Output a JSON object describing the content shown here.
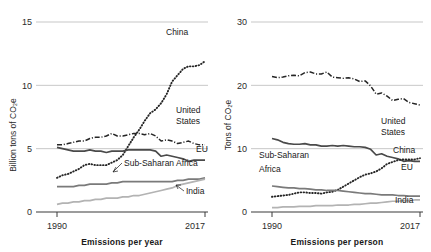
{
  "figure": {
    "panels": [
      {
        "id": "per-year",
        "caption": "Emissions per year",
        "ylabel": "Billion tons of CO₂e",
        "x_start_label": "1990",
        "x_end_label": "2017",
        "yticks": [
          "0",
          "5",
          "10",
          "15"
        ]
      },
      {
        "id": "per-person",
        "caption": "Emissions per person",
        "ylabel": "Tons of CO₂e",
        "x_start_label": "1990",
        "x_end_label": "2017",
        "yticks": [
          "0",
          "10",
          "20",
          "30"
        ]
      }
    ],
    "labels": {
      "china": "China",
      "united_states_line1": "United",
      "united_states_line2": "States",
      "eu": "EU",
      "ssa_one_line": "Sub-Saharan Africa",
      "ssa_line1": "Sub-Saharan",
      "ssa_line2": "Africa",
      "india": "India"
    },
    "colors": {
      "china": "#262626",
      "united_states": "#262626",
      "eu": "#4a4a4a",
      "sub_saharan_africa": "#7a7a7a",
      "india": "#b3b3b3",
      "gridline": "#b9b9b9",
      "axis": "#3a3a3a",
      "text": "#1a1a1a"
    }
  },
  "chart_data": [
    {
      "type": "line",
      "title": "Emissions per year",
      "xlabel": "Emissions per year",
      "ylabel": "Billion tons of CO₂e",
      "xlim": [
        1990,
        2017
      ],
      "ylim": [
        0,
        15
      ],
      "yticks": [
        0,
        5,
        10,
        15
      ],
      "xticks": [
        1990,
        2017
      ],
      "grid": true,
      "legend": "inline-labels",
      "x": [
        1990,
        1991,
        1992,
        1993,
        1994,
        1995,
        1996,
        1997,
        1998,
        1999,
        2000,
        2001,
        2002,
        2003,
        2004,
        2005,
        2006,
        2007,
        2008,
        2009,
        2010,
        2011,
        2012,
        2013,
        2014,
        2015,
        2016,
        2017
      ],
      "series": [
        {
          "name": "China",
          "style": "dotted",
          "color": "#262626",
          "values": [
            2.7,
            2.9,
            3.0,
            3.2,
            3.4,
            3.7,
            3.8,
            3.7,
            3.7,
            3.7,
            3.9,
            4.1,
            4.5,
            5.2,
            5.9,
            6.5,
            7.2,
            7.8,
            8.1,
            8.6,
            9.3,
            10.3,
            10.8,
            11.3,
            11.5,
            11.5,
            11.6,
            11.9
          ]
        },
        {
          "name": "United States",
          "style": "dashdot",
          "color": "#262626",
          "values": [
            5.3,
            5.3,
            5.4,
            5.5,
            5.6,
            5.6,
            5.8,
            5.9,
            5.9,
            6.0,
            6.2,
            6.0,
            6.0,
            6.1,
            6.2,
            6.2,
            6.1,
            6.2,
            6.0,
            5.6,
            5.7,
            5.6,
            5.4,
            5.5,
            5.6,
            5.4,
            5.3,
            5.3
          ]
        },
        {
          "name": "EU",
          "style": "solid",
          "color": "#4a4a4a",
          "values": [
            5.1,
            5.0,
            4.9,
            4.8,
            4.8,
            4.8,
            4.9,
            4.8,
            4.8,
            4.7,
            4.8,
            4.8,
            4.8,
            4.9,
            4.9,
            4.9,
            4.9,
            4.9,
            4.8,
            4.4,
            4.5,
            4.4,
            4.3,
            4.2,
            4.0,
            4.1,
            4.1,
            4.1
          ]
        },
        {
          "name": "Sub-Saharan Africa",
          "style": "solid",
          "color": "#7a7a7a",
          "values": [
            2.0,
            2.0,
            2.0,
            2.0,
            2.1,
            2.1,
            2.2,
            2.2,
            2.2,
            2.2,
            2.3,
            2.3,
            2.4,
            2.4,
            2.4,
            2.4,
            2.4,
            2.4,
            2.4,
            2.4,
            2.4,
            2.4,
            2.5,
            2.5,
            2.6,
            2.6,
            2.6,
            2.7
          ]
        },
        {
          "name": "India",
          "style": "solid",
          "color": "#b3b3b3",
          "values": [
            0.6,
            0.7,
            0.7,
            0.8,
            0.8,
            0.9,
            0.9,
            1.0,
            1.0,
            1.1,
            1.1,
            1.1,
            1.2,
            1.2,
            1.3,
            1.3,
            1.4,
            1.5,
            1.6,
            1.7,
            1.8,
            1.9,
            2.1,
            2.2,
            2.3,
            2.4,
            2.5,
            2.6
          ]
        }
      ]
    },
    {
      "type": "line",
      "title": "Emissions per person",
      "xlabel": "Emissions per person",
      "ylabel": "Tons of CO₂e",
      "xlim": [
        1990,
        2017
      ],
      "ylim": [
        0,
        30
      ],
      "yticks": [
        0,
        10,
        20,
        30
      ],
      "xticks": [
        1990,
        2017
      ],
      "grid": true,
      "legend": "inline-labels",
      "x": [
        1990,
        1991,
        1992,
        1993,
        1994,
        1995,
        1996,
        1997,
        1998,
        1999,
        2000,
        2001,
        2002,
        2003,
        2004,
        2005,
        2006,
        2007,
        2008,
        2009,
        2010,
        2011,
        2012,
        2013,
        2014,
        2015,
        2016,
        2017
      ],
      "series": [
        {
          "name": "United States",
          "style": "dashdot",
          "color": "#262626",
          "values": [
            21.4,
            21.2,
            21.3,
            21.5,
            21.6,
            21.5,
            22.0,
            22.1,
            21.8,
            21.8,
            22.1,
            21.3,
            21.2,
            21.1,
            21.2,
            21.0,
            20.6,
            20.7,
            19.9,
            18.6,
            18.8,
            18.3,
            17.6,
            17.8,
            17.9,
            17.3,
            17.1,
            16.9
          ]
        },
        {
          "name": "EU",
          "style": "solid",
          "color": "#4a4a4a",
          "values": [
            11.6,
            11.4,
            11.0,
            10.8,
            10.7,
            10.7,
            10.8,
            10.6,
            10.6,
            10.4,
            10.4,
            10.5,
            10.4,
            10.5,
            10.4,
            10.3,
            10.3,
            10.2,
            9.9,
            9.0,
            9.2,
            8.8,
            8.6,
            8.4,
            8.0,
            8.1,
            8.0,
            8.0
          ]
        },
        {
          "name": "China",
          "style": "dotted",
          "color": "#262626",
          "values": [
            2.4,
            2.5,
            2.6,
            2.7,
            2.9,
            3.1,
            3.1,
            3.0,
            3.0,
            2.9,
            3.1,
            3.2,
            3.5,
            4.0,
            4.5,
            5.0,
            5.5,
            5.9,
            6.1,
            6.4,
            6.9,
            7.6,
            7.9,
            8.2,
            8.3,
            8.3,
            8.3,
            8.5
          ]
        },
        {
          "name": "Sub-Saharan Africa",
          "style": "solid",
          "color": "#7a7a7a",
          "values": [
            4.1,
            4.0,
            3.9,
            3.8,
            3.8,
            3.7,
            3.7,
            3.6,
            3.5,
            3.5,
            3.4,
            3.4,
            3.4,
            3.3,
            3.2,
            3.1,
            3.0,
            2.9,
            2.9,
            2.8,
            2.7,
            2.7,
            2.7,
            2.6,
            2.6,
            2.5,
            2.5,
            2.5
          ]
        },
        {
          "name": "India",
          "style": "solid",
          "color": "#b3b3b3",
          "values": [
            0.7,
            0.7,
            0.8,
            0.8,
            0.8,
            0.9,
            0.9,
            0.9,
            1.0,
            1.0,
            1.0,
            1.0,
            1.1,
            1.1,
            1.1,
            1.2,
            1.2,
            1.3,
            1.4,
            1.4,
            1.5,
            1.6,
            1.7,
            1.7,
            1.8,
            1.8,
            1.9,
            1.9
          ]
        }
      ]
    }
  ]
}
